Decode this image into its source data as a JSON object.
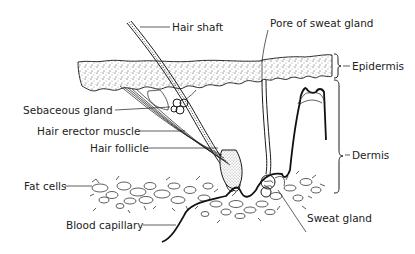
{
  "diagram": {
    "labels": {
      "hair_shaft": "Hair shaft",
      "pore_of_sweat_gland": "Pore of sweat gland",
      "epidermis": "Epidermis",
      "sebaceous_gland": "Sebaceous gland",
      "hair_erector_muscle": "Hair erector muscle",
      "hair_follicle": "Hair follicle",
      "dermis": "Dermis",
      "fat_cells": "Fat cells",
      "sweat_gland": "Sweat gland",
      "blood_capillary": "Blood capillary"
    },
    "colors": {
      "ink": "#1a1a1a",
      "background": "#ffffff"
    }
  }
}
